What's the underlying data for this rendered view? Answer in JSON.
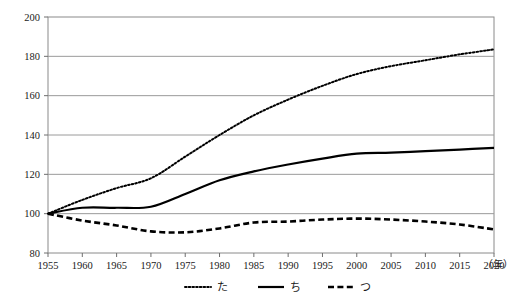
{
  "chart_data": {
    "type": "line",
    "title": "",
    "subtitle": "",
    "xlabel": "年",
    "ylabel": "",
    "xlim": [
      1955,
      2020
    ],
    "ylim": [
      80,
      200
    ],
    "y_ticks": [
      80,
      100,
      120,
      140,
      160,
      180,
      200
    ],
    "x_ticks": [
      1955,
      1960,
      1965,
      1970,
      1975,
      1980,
      1985,
      1990,
      1995,
      2000,
      2005,
      2010,
      2015,
      2020
    ],
    "x_tick_labels": [
      "1955",
      "1960",
      "1965",
      "1970",
      "1975",
      "1980",
      "1985",
      "1990",
      "1995",
      "2000",
      "2005",
      "2010",
      "2015",
      "2020"
    ],
    "y_tick_labels": [
      "80",
      "100",
      "120",
      "140",
      "160",
      "180",
      "200"
    ],
    "grid": "horizontal",
    "legend_position": "bottom",
    "x": [
      1955,
      1960,
      1965,
      1970,
      1975,
      1980,
      1985,
      1990,
      1995,
      2000,
      2005,
      2010,
      2015,
      2020
    ],
    "series": [
      {
        "name": "た",
        "line_style": "dotted",
        "color": "#000000",
        "values": [
          100,
          107,
          113,
          118,
          129,
          140,
          150,
          158,
          165,
          171,
          175,
          178,
          181,
          183.5
        ]
      },
      {
        "name": "ち",
        "line_style": "solid",
        "color": "#000000",
        "values": [
          100,
          103,
          103,
          103.5,
          110,
          117,
          121.5,
          125,
          128,
          130.5,
          131,
          131.8,
          132.6,
          133.5
        ]
      },
      {
        "name": "つ",
        "line_style": "dashed",
        "color": "#000000",
        "values": [
          100,
          96.5,
          94,
          91,
          90.5,
          92.5,
          95.5,
          96,
          97,
          97.5,
          97,
          96,
          94.5,
          92
        ]
      }
    ],
    "colors": {
      "axis": "#6e6e6e",
      "grid": "#9a9a9a",
      "plot_background": "#ffffff",
      "text": "#1a1a1a"
    }
  },
  "legend": {
    "items": [
      {
        "label": "た",
        "style": "dotted"
      },
      {
        "label": "ち",
        "style": "solid"
      },
      {
        "label": "つ",
        "style": "dashed"
      }
    ]
  },
  "axis": {
    "x_unit_label": "（年）"
  }
}
